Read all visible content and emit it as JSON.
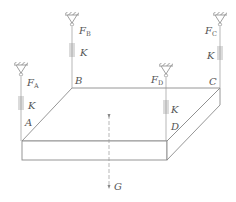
{
  "diagram": {
    "type": "mechanics-free-body",
    "colors": {
      "line": "#8a8a8a",
      "text": "#555555",
      "background": "#ffffff"
    },
    "corners": [
      {
        "id": "A",
        "label": "A",
        "force": {
          "label": "F",
          "sub": "A"
        },
        "spring": "K"
      },
      {
        "id": "B",
        "label": "B",
        "force": {
          "label": "F",
          "sub": "B"
        },
        "spring": "K"
      },
      {
        "id": "C",
        "label": "C",
        "force": {
          "label": "F",
          "sub": "C"
        },
        "spring": "K"
      },
      {
        "id": "D",
        "label": "D",
        "force": {
          "label": "F",
          "sub": "D"
        },
        "spring": "K"
      }
    ],
    "weight": {
      "label": "G"
    }
  }
}
